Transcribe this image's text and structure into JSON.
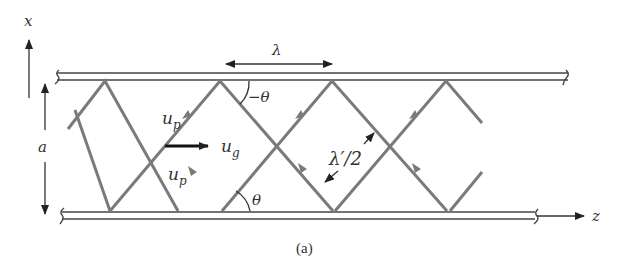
{
  "figure": {
    "caption": "(a)"
  },
  "axes": {
    "x_label": "x",
    "z_label": "z"
  },
  "labels": {
    "wavelength": "λ",
    "angle_top": "−θ",
    "angle_bottom": "θ",
    "phase_velocity_top": "u",
    "phase_velocity_top_sub": "p",
    "phase_velocity_bottom": "u",
    "phase_velocity_bottom_sub": "p",
    "group_velocity": "u",
    "group_velocity_sub": "g",
    "separation": "a",
    "half_wavelength_prime": "λ′/2"
  },
  "colors": {
    "ray": "#7a7a7a",
    "wall": "#444444",
    "ink": "#222222"
  }
}
